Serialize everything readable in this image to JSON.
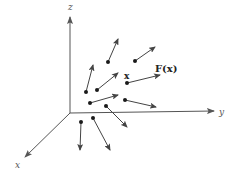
{
  "diagram": {
    "axes": {
      "origin": [
        70,
        113
      ],
      "z": {
        "label": "z",
        "end": [
          70,
          17
        ],
        "label_pos": [
          68,
          10
        ]
      },
      "y": {
        "label": "y",
        "end": [
          214,
          111
        ],
        "label_pos": [
          219,
          115
        ]
      },
      "x": {
        "label": "x",
        "end": [
          25,
          157
        ],
        "label_pos": [
          15,
          168
        ]
      }
    },
    "labels": {
      "point_label": "x",
      "field_label": "F(x)"
    },
    "vectors": [
      {
        "from": [
          108,
          62
        ],
        "to": [
          118,
          39
        ]
      },
      {
        "from": [
          135,
          61
        ],
        "to": [
          155,
          47
        ]
      },
      {
        "from": [
          86,
          92
        ],
        "to": [
          93,
          65
        ]
      },
      {
        "from": [
          97,
          90
        ],
        "to": [
          118,
          73
        ]
      },
      {
        "from": [
          127,
          83
        ],
        "to": [
          160,
          75
        ]
      },
      {
        "from": [
          90,
          103
        ],
        "to": [
          118,
          95
        ]
      },
      {
        "from": [
          125,
          100
        ],
        "to": [
          156,
          107
        ]
      },
      {
        "from": [
          106,
          106
        ],
        "to": [
          127,
          127
        ]
      },
      {
        "from": [
          81,
          122
        ],
        "to": [
          80,
          150
        ]
      },
      {
        "from": [
          93,
          118
        ],
        "to": [
          110,
          150
        ]
      }
    ],
    "colors": {
      "axis": "#555555",
      "vector": "#444444",
      "dot": "#1a1a1a"
    }
  }
}
